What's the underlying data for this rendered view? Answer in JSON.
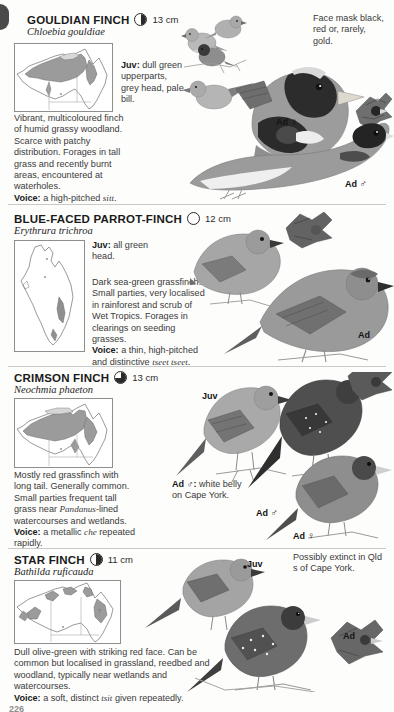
{
  "page": {
    "folio": "226",
    "thumb_tab": "thumb-index-tab"
  },
  "species": [
    {
      "id": "gouldian-finch",
      "common_name": "GOULDIAN FINCH",
      "scientific_name": "Chloebia gouldiae",
      "size": "13 cm",
      "size_icon": "pie-quarter-icon",
      "description_html": "Vibrant, multicoloured finch of humid grassy woodland. Scarce with patchy distribution. Forages in tall grass and recently burnt areas, encountered at waterholes.",
      "voice_label": "Voice:",
      "voice_text_html": "a high-pitched <i>sitt</i>.",
      "callouts": [
        {
          "id": "juv-callout",
          "label": "Juv:",
          "text": "dull green upperparts, grey head, pale bill."
        },
        {
          "id": "face-mask-note",
          "label": "",
          "text": "Face mask black, red or, rarely, gold."
        }
      ],
      "figure_labels": [
        {
          "id": "ad-female",
          "text": "Ad",
          "symbol": "♀"
        },
        {
          "id": "ad-male",
          "text": "Ad",
          "symbol": "♂"
        }
      ]
    },
    {
      "id": "blue-faced-parrot-finch",
      "common_name": "BLUE-FACED PARROT-FINCH",
      "scientific_name": "Erythrura trichroa",
      "size": "12 cm",
      "size_icon": "circle-empty-icon",
      "description_html": "Dark sea-green grassfinch. Small parties, very localised in rainforest and scrub of Wet Tropics. Forages in clearings on seeding grasses.",
      "voice_label": "Voice:",
      "voice_text_html": "a thin, high-pitched and distinctive <i>tseet tseet</i>.",
      "callouts": [
        {
          "id": "juv-callout",
          "label": "Juv:",
          "text": "all green head."
        }
      ],
      "figure_labels": [
        {
          "id": "ad",
          "text": "Ad",
          "symbol": ""
        }
      ]
    },
    {
      "id": "crimson-finch",
      "common_name": "CRIMSON FINCH",
      "scientific_name": "Neochmia phaeton",
      "size": "13 cm",
      "size_icon": "pie-three-quarter-icon",
      "description_html": "Mostly red grassfinch with long tail. Generally common. Small parties frequent tall grass near <i>Pandanus</i>-lined watercourses and wetlands.",
      "voice_label": "Voice:",
      "voice_text_html": "a metallic <i>che</i> repeated rapidly.",
      "callouts": [
        {
          "id": "ad-male-white-belly-note",
          "label": "Ad ♂:",
          "text": "white belly on Cape York."
        }
      ],
      "figure_labels": [
        {
          "id": "juv",
          "text": "Juv",
          "symbol": ""
        },
        {
          "id": "ad-male",
          "text": "Ad",
          "symbol": "♂"
        },
        {
          "id": "ad-female",
          "text": "Ad",
          "symbol": "♀"
        }
      ]
    },
    {
      "id": "star-finch",
      "common_name": "STAR FINCH",
      "scientific_name": "Bathilda ruficauda",
      "size": "11 cm",
      "size_icon": "half-circle-icon",
      "description_html": "Dull olive-green with striking red face. Can be common but localised in grassland, reedbed and woodland, typically near wetlands and watercourses.",
      "voice_label": "Voice:",
      "voice_text_html": "a soft, distinct <i>tsit</i> given repeatedly.",
      "callouts": [
        {
          "id": "extinct-note",
          "label": "",
          "text": "Possibly extinct in Qld s of Cape York."
        }
      ],
      "figure_labels": [
        {
          "id": "juv",
          "text": "Juv",
          "symbol": ""
        },
        {
          "id": "ad",
          "text": "Ad",
          "symbol": ""
        }
      ]
    }
  ],
  "colors": {
    "rule": "#c9c9c9",
    "map_border": "#8e8e8e",
    "map_range": "#9a9a9a",
    "text": "#3a3a3a",
    "heading": "#1a1a1a"
  }
}
